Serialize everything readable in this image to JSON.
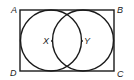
{
  "diagram": {
    "type": "geometry",
    "stroke_color": "#1a1a1a",
    "rectangle": {
      "vertices": {
        "A": {
          "label": "A",
          "x": 20,
          "y": 10
        },
        "B": {
          "label": "B",
          "x": 114,
          "y": 10
        },
        "C": {
          "label": "C",
          "x": 114,
          "y": 71
        },
        "D": {
          "label": "D",
          "x": 20,
          "y": 71
        }
      }
    },
    "circles": [
      {
        "center_label": "X",
        "cx": 51,
        "cy": 40.5,
        "r": 30.5
      },
      {
        "center_label": "Y",
        "cx": 83,
        "cy": 40.5,
        "r": 30.5
      }
    ]
  }
}
